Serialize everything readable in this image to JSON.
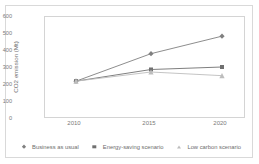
{
  "chart_data": {
    "type": "line",
    "title": "",
    "xlabel": "",
    "ylabel": "CO2 emission (Mt)",
    "categories": [
      "2010",
      "2015",
      "2020"
    ],
    "x": [
      2010,
      2015,
      2020
    ],
    "ylim": [
      0,
      600
    ],
    "yticks": [
      "0",
      "100",
      "200",
      "300",
      "400",
      "500",
      "600"
    ],
    "ytick_values": [
      0,
      100,
      200,
      300,
      400,
      500,
      600
    ],
    "grid": false,
    "legend_position": "bottom",
    "series": [
      {
        "name": "Business as usual",
        "marker": "diamond",
        "color": "#808080",
        "values": [
          215,
          380,
          485
        ]
      },
      {
        "name": "Energy-saving scenario",
        "marker": "square",
        "color": "#707070",
        "values": [
          215,
          285,
          300
        ]
      },
      {
        "name": "Low carbon scenario",
        "marker": "triangle",
        "color": "#bdbdbd",
        "values": [
          215,
          270,
          248
        ]
      }
    ]
  },
  "axis": {
    "y_title": "CO2 emission (Mt)",
    "y_ticks": [
      "600",
      "500",
      "400",
      "300",
      "200",
      "100",
      "0"
    ],
    "x_ticks": [
      "2010",
      "2015",
      "2020"
    ]
  },
  "legend": {
    "items": [
      {
        "label": "Business as usual"
      },
      {
        "label": "Energy-saving scenario"
      },
      {
        "label": "Low carbon scenario"
      }
    ]
  },
  "colors": {
    "series1": "#808080",
    "series2": "#707070",
    "series3": "#bdbdbd",
    "frame": "#d4d4d4",
    "text": "#7a7a7a"
  }
}
